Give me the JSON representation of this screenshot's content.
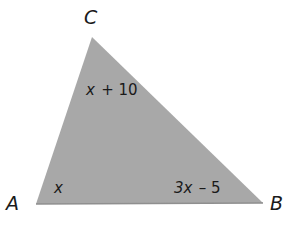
{
  "figure": {
    "kind": "triangle-angle-diagram",
    "fill_color": "#a8a8a8",
    "edge_color": "#8f8f8f",
    "background_color": "#ffffff",
    "text_color": "#1a1a1a",
    "vertices": [
      {
        "name": "C",
        "label": "C",
        "x": 92,
        "y": 37
      },
      {
        "name": "A",
        "label": "A",
        "x": 36,
        "y": 204
      },
      {
        "name": "B",
        "label": "B",
        "x": 263,
        "y": 203
      }
    ],
    "vertex_labels": {
      "C": "C",
      "A": "A",
      "B": "B"
    },
    "angle_labels": {
      "at_C": {
        "variable": "x",
        "operator": "+",
        "constant": "10",
        "text": "x + 10"
      },
      "at_A": {
        "variable": "x",
        "operator": "",
        "constant": "",
        "text": "x"
      },
      "at_B": {
        "variable": "3x",
        "operator": "–",
        "constant": "5",
        "text": "3x – 5"
      }
    }
  }
}
